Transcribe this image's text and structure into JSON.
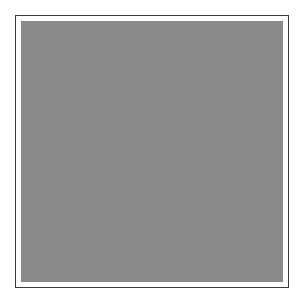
{
  "figure": {
    "kind": "noise-field-plate",
    "width": 304,
    "height": 303,
    "page_background": "#ffffff",
    "alt_text": ""
  },
  "frame": {
    "name": "plate-border",
    "stroke_color": "#3a3a3a",
    "stroke_width_px": 1,
    "left_px": 15,
    "top_px": 15,
    "width_px": 274,
    "height_px": 273,
    "fill_color": "#ffffff"
  },
  "matte": {
    "name": "inner-white-gap",
    "padding_px": 5,
    "color": "#ffffff"
  },
  "noise": {
    "name": "random-gray-noise",
    "mean_gray": "#8a8a8a",
    "min_gray": "#5e5e5e",
    "max_gray": "#b4b4b4",
    "grain_size_px": 1,
    "amplitude": 40,
    "distribution": "uniform-random",
    "region_left_px": 21,
    "region_top_px": 21,
    "region_width_px": 262,
    "region_height_px": 261,
    "has_gradient": false,
    "has_structure": false,
    "has_text": false
  },
  "labels": {
    "caption": "",
    "title": "",
    "axis_x": "",
    "axis_y": ""
  }
}
